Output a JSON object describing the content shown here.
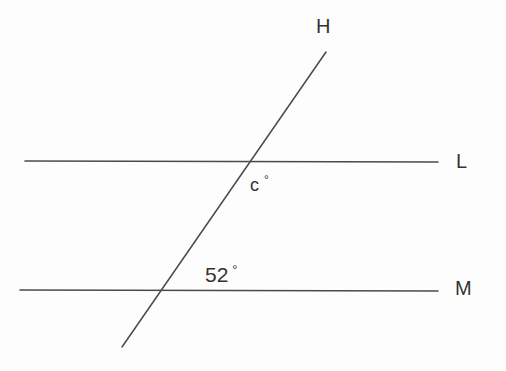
{
  "figure": {
    "background_color": "#fdfdfd",
    "stroke_color": "#4a4a4a",
    "text_color": "#333333"
  },
  "lines": {
    "upper_parallel": {
      "label": "L",
      "name": "line-L",
      "x1": 25,
      "y1": 161,
      "x2": 438,
      "y2": 162
    },
    "lower_parallel": {
      "label": "M",
      "name": "line-M",
      "x1": 20,
      "y1": 290,
      "x2": 438,
      "y2": 291
    },
    "transversal": {
      "label": "H",
      "name": "line-H",
      "x1": 122,
      "y1": 347,
      "x2": 326,
      "y2": 52
    }
  },
  "intersections": {
    "with_L": {
      "x": 247,
      "y": 161
    },
    "with_M": {
      "x": 158,
      "y": 290
    }
  },
  "angles": {
    "unknown": {
      "value": "c",
      "degree_symbol": "°",
      "position": {
        "x": 256,
        "y": 186
      },
      "location": "below-right of intersection with line L"
    },
    "known": {
      "value": "52",
      "degree_symbol": "°",
      "position": {
        "x": 207,
        "y": 276
      },
      "location": "above-right of intersection with line M"
    }
  }
}
